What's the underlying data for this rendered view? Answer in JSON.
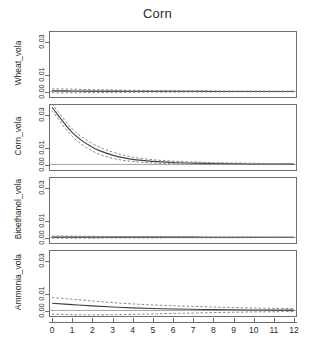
{
  "chart_data": {
    "type": "line",
    "title": "Corn",
    "xlabel": "",
    "ylabel": "",
    "grid": false,
    "legend": "none",
    "x": [
      0,
      1,
      2,
      3,
      4,
      5,
      6,
      7,
      8,
      9,
      10,
      11,
      12
    ],
    "xlim": [
      0,
      12
    ],
    "xticks": [
      "0",
      "1",
      "2",
      "3",
      "4",
      "5",
      "6",
      "7",
      "8",
      "9",
      "10",
      "11",
      "12"
    ],
    "panels": [
      {
        "name": "Wheat_vola",
        "ylabel": "Wheat_vola",
        "ylim": [
          -0.004,
          0.037
        ],
        "yticks": [
          "0.00",
          "0.01",
          "0.03"
        ],
        "ytick_values": [
          0.0,
          0.01,
          0.03
        ],
        "series": [
          {
            "name": "response",
            "style": "solid",
            "values": [
              0.0004,
              0.0003,
              0.0002,
              0.0002,
              0.0001,
              0.0001,
              0.0001,
              0.0001,
              0.0,
              0.0,
              0.0,
              0.0,
              0.0
            ]
          },
          {
            "name": "upper_ci",
            "style": "dashed",
            "values": [
              0.0016,
              0.0014,
              0.0011,
              0.0009,
              0.0007,
              0.0006,
              0.0005,
              0.0004,
              0.0004,
              0.0003,
              0.0003,
              0.0002,
              0.0002
            ]
          },
          {
            "name": "lower_ci",
            "style": "dashed",
            "values": [
              -0.0008,
              -0.0008,
              -0.0007,
              -0.0006,
              -0.0005,
              -0.0004,
              -0.0004,
              -0.0003,
              -0.0003,
              -0.0002,
              -0.0002,
              -0.0002,
              -0.0002
            ]
          }
        ]
      },
      {
        "name": "Corn_vola",
        "ylabel": "Corn_vola",
        "ylim": [
          -0.004,
          0.037
        ],
        "yticks": [
          "0.00",
          "0.01",
          "0.03"
        ],
        "ytick_values": [
          0.0,
          0.01,
          0.03
        ],
        "series": [
          {
            "name": "response",
            "style": "solid",
            "values": [
              0.035,
              0.0196,
              0.0105,
              0.0057,
              0.0031,
              0.0019,
              0.0012,
              0.0008,
              0.0006,
              0.0004,
              0.0003,
              0.0003,
              0.0002
            ]
          },
          {
            "name": "upper_ci",
            "style": "dashed",
            "values": [
              0.0372,
              0.0218,
              0.0128,
              0.0076,
              0.0045,
              0.0029,
              0.002,
              0.0015,
              0.0011,
              0.0009,
              0.0007,
              0.0006,
              0.0005
            ]
          },
          {
            "name": "lower_ci",
            "style": "dashed",
            "values": [
              0.033,
              0.0172,
              0.0082,
              0.0038,
              0.0018,
              0.0009,
              0.0005,
              0.0003,
              0.0002,
              0.0002,
              0.0001,
              0.0001,
              0.0001
            ]
          }
        ]
      },
      {
        "name": "Bioethanol_vola",
        "ylabel": "Bioethanol_vola",
        "ylim": [
          -0.004,
          0.037
        ],
        "yticks": [
          "0.00",
          "0.01",
          "0.03"
        ],
        "ytick_values": [
          0.0,
          0.01,
          0.03
        ],
        "series": [
          {
            "name": "response",
            "style": "solid",
            "values": [
              0.0002,
              0.0002,
              0.0002,
              0.0002,
              0.0002,
              0.0002,
              0.0002,
              0.0002,
              0.0001,
              0.0001,
              0.0001,
              0.0001,
              0.0001
            ]
          },
          {
            "name": "upper_ci",
            "style": "dashed",
            "values": [
              0.0009,
              0.0008,
              0.0007,
              0.0006,
              0.0005,
              0.0005,
              0.0004,
              0.0004,
              0.0003,
              0.0003,
              0.0003,
              0.0002,
              0.0002
            ]
          },
          {
            "name": "lower_ci",
            "style": "dashed",
            "values": [
              -0.0004,
              -0.0004,
              -0.0004,
              -0.0003,
              -0.0003,
              -0.0003,
              -0.0002,
              -0.0002,
              -0.0002,
              -0.0002,
              -0.0001,
              -0.0001,
              -0.0001
            ]
          }
        ]
      },
      {
        "name": "Ammonia_vola",
        "ylabel": "Ammonia_vola",
        "ylim": [
          -0.004,
          0.037
        ],
        "yticks": [
          "0.00",
          "0.01",
          "0.03"
        ],
        "ytick_values": [
          0.0,
          0.01,
          0.03
        ],
        "series": [
          {
            "name": "response",
            "style": "solid",
            "values": [
              0.0044,
              0.0036,
              0.0028,
              0.0021,
              0.0016,
              0.0012,
              0.0009,
              0.0007,
              0.0005,
              0.0004,
              0.0003,
              0.0002,
              0.0002
            ]
          },
          {
            "name": "upper_ci",
            "style": "dashed",
            "values": [
              0.008,
              0.0069,
              0.0058,
              0.0048,
              0.004,
              0.0034,
              0.0029,
              0.0025,
              0.0021,
              0.0018,
              0.0015,
              0.0013,
              0.0011
            ]
          },
          {
            "name": "lower_ci",
            "style": "dashed",
            "values": [
              -0.0022,
              -0.0026,
              -0.0027,
              -0.0026,
              -0.0024,
              -0.0021,
              -0.0018,
              -0.0016,
              -0.0013,
              -0.0011,
              -0.0009,
              -0.0008,
              -0.0006
            ]
          }
        ]
      }
    ]
  }
}
